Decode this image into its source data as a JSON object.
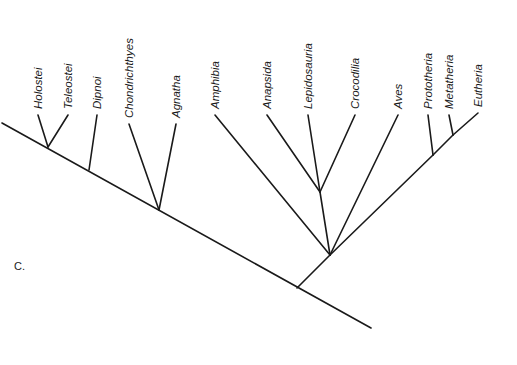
{
  "figure": {
    "panel_label": "C.",
    "type": "cladogram",
    "taxa": [
      {
        "name": "Holostei",
        "tip": [
          38,
          115
        ],
        "node": [
          48,
          147
        ]
      },
      {
        "name": "Teleostei",
        "tip": [
          68,
          115
        ],
        "node": [
          48,
          147
        ]
      },
      {
        "name": "Dipnoi",
        "tip": [
          97,
          115
        ],
        "node": [
          89,
          170
        ]
      },
      {
        "name": "Chondrichthyes",
        "tip": [
          129,
          124
        ],
        "node": [
          159,
          210
        ]
      },
      {
        "name": "Agnatha",
        "tip": [
          176,
          124
        ],
        "node": [
          159,
          210
        ]
      },
      {
        "name": "Amphibia",
        "tip": [
          215,
          115
        ],
        "node": [
          330,
          255
        ]
      },
      {
        "name": "Anapsida",
        "tip": [
          267,
          115
        ],
        "node": [
          320,
          192
        ]
      },
      {
        "name": "Lepidosauria",
        "tip": [
          308,
          115
        ],
        "node": [
          320,
          192
        ]
      },
      {
        "name": "Crocodilia",
        "tip": [
          355,
          115
        ],
        "node": [
          320,
          192
        ]
      },
      {
        "name": "Aves",
        "tip": [
          398,
          115
        ],
        "node": [
          330,
          255
        ]
      },
      {
        "name": "Prototheria",
        "tip": [
          428,
          115
        ],
        "node": [
          433,
          155
        ]
      },
      {
        "name": "Metatheria",
        "tip": [
          449,
          115
        ],
        "node": [
          453,
          135
        ]
      },
      {
        "name": "Eutheria",
        "tip": [
          478,
          113
        ],
        "node": [
          453,
          135
        ]
      }
    ],
    "internal_edges": [
      {
        "from": [
          2,
          123
        ],
        "to": [
          371,
          328
        ],
        "role": "backbone"
      },
      {
        "from": [
          297,
          288
        ],
        "to": [
          330,
          255
        ],
        "role": "tetrapod-stem"
      },
      {
        "from": [
          330,
          255
        ],
        "to": [
          320,
          192
        ],
        "role": "reptile-stem"
      },
      {
        "from": [
          330,
          255
        ],
        "to": [
          433,
          155
        ],
        "role": "mammal-stem"
      },
      {
        "from": [
          433,
          155
        ],
        "to": [
          453,
          135
        ],
        "role": "therian-stem"
      }
    ],
    "line_color": "#1a1a1a",
    "label_color": "#1a1a1a"
  }
}
